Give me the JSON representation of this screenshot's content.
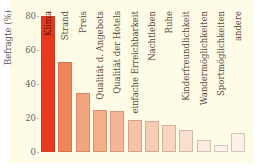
{
  "chart_data": {
    "type": "bar",
    "title": "",
    "xlabel": "",
    "ylabel": "Befragte (%)",
    "ylim": [
      0,
      80
    ],
    "yticks": [
      0,
      20,
      40,
      60,
      80
    ],
    "grid": false,
    "legend": null,
    "categories": [
      "Klima",
      "Strand",
      "Preis",
      "Qualität d. Angebots",
      "Qualität der Hotels",
      "einfache Erreichbarkeit",
      "Nachtleben",
      "Ruhe",
      "Kinderfreundlichkeit",
      "Wandermöglichkeiten",
      "Sportmöglichkeiten",
      "andere"
    ],
    "values": [
      80,
      53,
      35,
      25,
      24,
      19,
      18,
      16,
      13,
      7,
      4,
      11
    ],
    "colors": [
      "#e8391c",
      "#f0845a",
      "#f4a47e",
      "#f5ad8a",
      "#f6b696",
      "#f7c3a8",
      "#f8ccb4",
      "#f9d6c2",
      "#fadfcf",
      "#fcece2",
      "#fdf3ec",
      "#fbf1e8"
    ]
  },
  "axis": {
    "ylabel": "Befragte (%)",
    "ticks": [
      "0",
      "20",
      "40",
      "60",
      "80"
    ]
  }
}
